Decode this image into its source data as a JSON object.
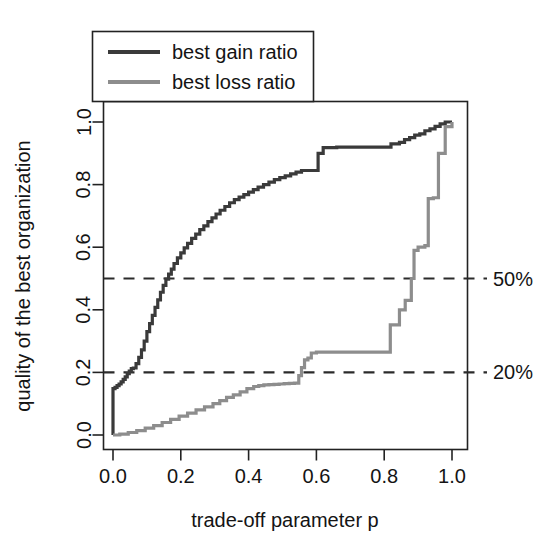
{
  "chart_data": {
    "type": "line",
    "title": "",
    "xlabel": "trade-off parameter p",
    "ylabel": "quality of the best organization",
    "xlim": [
      -0.035,
      1.035
    ],
    "ylim": [
      -0.04,
      1.04
    ],
    "xticks": [
      0.0,
      0.2,
      0.4,
      0.6,
      0.8,
      1.0
    ],
    "xtick_labels": [
      "0.0",
      "0.2",
      "0.4",
      "0.6",
      "0.8",
      "1.0"
    ],
    "yticks": [
      0.0,
      0.2,
      0.4,
      0.6,
      0.8,
      1.0
    ],
    "ytick_labels": [
      "0.0",
      "0.2",
      "0.4",
      "0.6",
      "0.8",
      "1.0"
    ],
    "grid": false,
    "legend_position": "top-left",
    "series": [
      {
        "name": "best gain ratio",
        "color": "#3a3a3a",
        "linewidth": 3.2,
        "style": "step",
        "x": [
          0.0,
          0.0,
          0.006,
          0.012,
          0.018,
          0.024,
          0.03,
          0.036,
          0.042,
          0.048,
          0.054,
          0.06,
          0.068,
          0.076,
          0.084,
          0.092,
          0.1,
          0.108,
          0.116,
          0.124,
          0.132,
          0.14,
          0.148,
          0.156,
          0.164,
          0.172,
          0.18,
          0.19,
          0.2,
          0.21,
          0.22,
          0.232,
          0.244,
          0.256,
          0.268,
          0.28,
          0.292,
          0.304,
          0.316,
          0.33,
          0.344,
          0.358,
          0.372,
          0.386,
          0.4,
          0.414,
          0.428,
          0.444,
          0.46,
          0.476,
          0.492,
          0.508,
          0.524,
          0.54,
          0.556,
          0.556,
          0.572,
          0.59,
          0.605,
          0.605,
          0.62,
          0.66,
          0.7,
          0.74,
          0.79,
          0.82,
          0.82,
          0.845,
          0.86,
          0.875,
          0.89,
          0.905,
          0.92,
          0.935,
          0.95,
          0.965,
          0.98,
          1.0
        ],
        "y": [
          0.0,
          0.148,
          0.152,
          0.158,
          0.163,
          0.17,
          0.178,
          0.186,
          0.196,
          0.204,
          0.212,
          0.214,
          0.228,
          0.248,
          0.272,
          0.3,
          0.33,
          0.356,
          0.382,
          0.408,
          0.432,
          0.456,
          0.478,
          0.498,
          0.514,
          0.53,
          0.548,
          0.566,
          0.582,
          0.598,
          0.612,
          0.628,
          0.642,
          0.656,
          0.668,
          0.682,
          0.694,
          0.706,
          0.718,
          0.73,
          0.742,
          0.752,
          0.76,
          0.768,
          0.776,
          0.784,
          0.792,
          0.8,
          0.808,
          0.816,
          0.822,
          0.828,
          0.834,
          0.84,
          0.845,
          0.845,
          0.845,
          0.845,
          0.845,
          0.9,
          0.918,
          0.92,
          0.92,
          0.92,
          0.92,
          0.92,
          0.93,
          0.935,
          0.944,
          0.95,
          0.958,
          0.962,
          0.972,
          0.978,
          0.986,
          0.994,
          1.0,
          1.0
        ]
      },
      {
        "name": "best loss ratio",
        "color": "#8d8d8d",
        "linewidth": 3.2,
        "style": "step",
        "x": [
          0.0,
          0.02,
          0.045,
          0.07,
          0.095,
          0.12,
          0.145,
          0.17,
          0.195,
          0.22,
          0.245,
          0.27,
          0.295,
          0.315,
          0.335,
          0.355,
          0.375,
          0.395,
          0.415,
          0.43,
          0.445,
          0.46,
          0.475,
          0.49,
          0.505,
          0.52,
          0.535,
          0.548,
          0.548,
          0.556,
          0.556,
          0.565,
          0.565,
          0.575,
          0.585,
          0.585,
          0.6,
          0.65,
          0.7,
          0.75,
          0.8,
          0.818,
          0.818,
          0.845,
          0.845,
          0.862,
          0.862,
          0.88,
          0.88,
          0.888,
          0.888,
          0.9,
          0.92,
          0.93,
          0.93,
          0.945,
          0.96,
          0.96,
          0.98,
          1.0
        ],
        "y": [
          0.0,
          0.003,
          0.008,
          0.014,
          0.022,
          0.03,
          0.04,
          0.05,
          0.06,
          0.07,
          0.08,
          0.09,
          0.1,
          0.11,
          0.12,
          0.128,
          0.138,
          0.148,
          0.155,
          0.158,
          0.16,
          0.161,
          0.162,
          0.163,
          0.164,
          0.165,
          0.166,
          0.168,
          0.19,
          0.196,
          0.215,
          0.222,
          0.24,
          0.246,
          0.252,
          0.262,
          0.265,
          0.265,
          0.265,
          0.265,
          0.265,
          0.265,
          0.352,
          0.355,
          0.4,
          0.402,
          0.43,
          0.432,
          0.5,
          0.508,
          0.59,
          0.6,
          0.605,
          0.608,
          0.755,
          0.758,
          0.76,
          0.9,
          0.985,
          1.0
        ]
      }
    ],
    "reference_lines": [
      {
        "name": "50-percent-line",
        "y": 0.5,
        "label": "50%",
        "style": "dashed",
        "color": "#2b2b2b"
      },
      {
        "name": "20-percent-line",
        "y": 0.2,
        "label": "20%",
        "style": "dashed",
        "color": "#2b2b2b"
      }
    ]
  },
  "legend": {
    "entries": [
      {
        "label": "best gain ratio",
        "color": "#3a3a3a"
      },
      {
        "label": "best loss ratio",
        "color": "#8d8d8d"
      }
    ]
  },
  "axes": {
    "x_title": "trade-off parameter p",
    "y_title": "quality of the best organization",
    "x_tick_labels": [
      "0.0",
      "0.2",
      "0.4",
      "0.6",
      "0.8",
      "1.0"
    ],
    "y_tick_labels": [
      "0.0",
      "0.2",
      "0.4",
      "0.6",
      "0.8",
      "1.0"
    ]
  },
  "annotations": {
    "fifty_percent": "50%",
    "twenty_percent": "20%"
  },
  "colors": {
    "gain": "#3a3a3a",
    "loss": "#8d8d8d",
    "axis": "#222222",
    "background": "#ffffff"
  }
}
